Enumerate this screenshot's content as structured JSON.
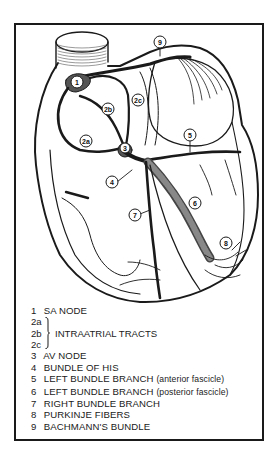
{
  "diagram": {
    "markers": [
      {
        "id": "9",
        "x": 160,
        "y": 42
      },
      {
        "id": "1",
        "x": 77,
        "y": 82
      },
      {
        "id": "2c",
        "x": 138,
        "y": 100
      },
      {
        "id": "2b",
        "x": 108,
        "y": 109
      },
      {
        "id": "2a",
        "x": 86,
        "y": 141
      },
      {
        "id": "3",
        "x": 125,
        "y": 148
      },
      {
        "id": "5",
        "x": 190,
        "y": 135
      },
      {
        "id": "4",
        "x": 112,
        "y": 182
      },
      {
        "id": "6",
        "x": 195,
        "y": 203
      },
      {
        "id": "7",
        "x": 135,
        "y": 215
      },
      {
        "id": "8",
        "x": 226,
        "y": 243
      }
    ]
  },
  "legend": {
    "item1": {
      "num": "1",
      "label": "SA NODE"
    },
    "group2": {
      "codes": [
        "2a",
        "2b",
        "2c"
      ],
      "label": "INTRAATRIAL TRACTS"
    },
    "item3": {
      "num": "3",
      "label": "AV NODE"
    },
    "item4": {
      "num": "4",
      "label": "BUNDLE OF HIS"
    },
    "item5": {
      "num": "5",
      "label": "LEFT BUNDLE BRANCH",
      "qualifier": "(anterior fascicle)"
    },
    "item6": {
      "num": "6",
      "label": "LEFT BUNDLE BRANCH",
      "qualifier": "(posterior fascicle)"
    },
    "item7": {
      "num": "7",
      "label": "RIGHT BUNDLE BRANCH"
    },
    "item8": {
      "num": "8",
      "label": "PURKINJE FIBERS"
    },
    "item9": {
      "num": "9",
      "label": "BACHMANN'S BUNDLE"
    }
  }
}
